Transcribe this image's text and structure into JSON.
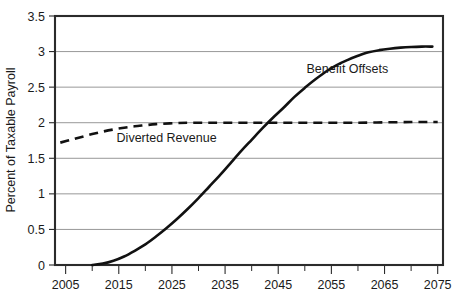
{
  "chart_data": {
    "type": "line",
    "title": "",
    "xlabel": "",
    "ylabel": "Percent of Taxable Payroll",
    "xlim": [
      2003,
      2076
    ],
    "ylim": [
      0,
      3.5
    ],
    "grid": true,
    "legend_position": "inline-annotations",
    "x_ticks": [
      "2005",
      "2015",
      "2025",
      "2035",
      "2045",
      "2055",
      "2065",
      "2075"
    ],
    "x_tick_values": [
      2005,
      2015,
      2025,
      2035,
      2045,
      2055,
      2065,
      2075
    ],
    "x_minor_tick_values": [
      2010,
      2020,
      2030,
      2040,
      2050,
      2060,
      2070
    ],
    "y_ticks": [
      "0",
      "0.5",
      "1",
      "1.5",
      "2",
      "2.5",
      "3",
      "3.5"
    ],
    "y_tick_values": [
      0,
      0.5,
      1,
      1.5,
      2,
      2.5,
      3,
      3.5
    ],
    "series": [
      {
        "name": "Benefit Offsets",
        "style": "solid",
        "annotation": "Benefit Offsets",
        "x": [
          2010,
          2012,
          2014,
          2016,
          2018,
          2020,
          2022,
          2024,
          2026,
          2028,
          2030,
          2032,
          2034,
          2036,
          2038,
          2040,
          2042,
          2044,
          2046,
          2048,
          2050,
          2052,
          2054,
          2056,
          2058,
          2060,
          2062,
          2064,
          2066,
          2068,
          2070,
          2072,
          2074
        ],
        "values": [
          0.0,
          0.02,
          0.06,
          0.12,
          0.2,
          0.29,
          0.4,
          0.52,
          0.65,
          0.79,
          0.94,
          1.1,
          1.26,
          1.43,
          1.6,
          1.76,
          1.92,
          2.07,
          2.21,
          2.36,
          2.49,
          2.61,
          2.72,
          2.81,
          2.88,
          2.94,
          2.99,
          3.02,
          3.04,
          3.055,
          3.065,
          3.07,
          3.07
        ]
      },
      {
        "name": "Diverted Revenue",
        "style": "dashed",
        "annotation": "Diverted Revenue",
        "x": [
          2004,
          2006,
          2008,
          2010,
          2012,
          2014,
          2016,
          2018,
          2020,
          2022,
          2026,
          2030,
          2040,
          2050,
          2060,
          2070,
          2075
        ],
        "values": [
          1.72,
          1.76,
          1.8,
          1.84,
          1.875,
          1.905,
          1.93,
          1.95,
          1.965,
          1.98,
          1.995,
          2.0,
          2.0,
          2.0,
          2.0,
          2.01,
          2.01
        ]
      }
    ],
    "annotations": [
      {
        "text": "Benefit Offsets",
        "x": 2058,
        "y": 2.7
      },
      {
        "text": "Diverted Revenue",
        "x": 2024,
        "y": 1.73
      }
    ]
  },
  "plot": {
    "left_px": 55,
    "right_px": 443,
    "top_px": 16,
    "bottom_px": 265
  },
  "colors": {
    "line": "#111111",
    "grid": "#8c8c8c",
    "frame": "#2b2b2b",
    "text": "#1a1a1a",
    "background": "#ffffff"
  }
}
